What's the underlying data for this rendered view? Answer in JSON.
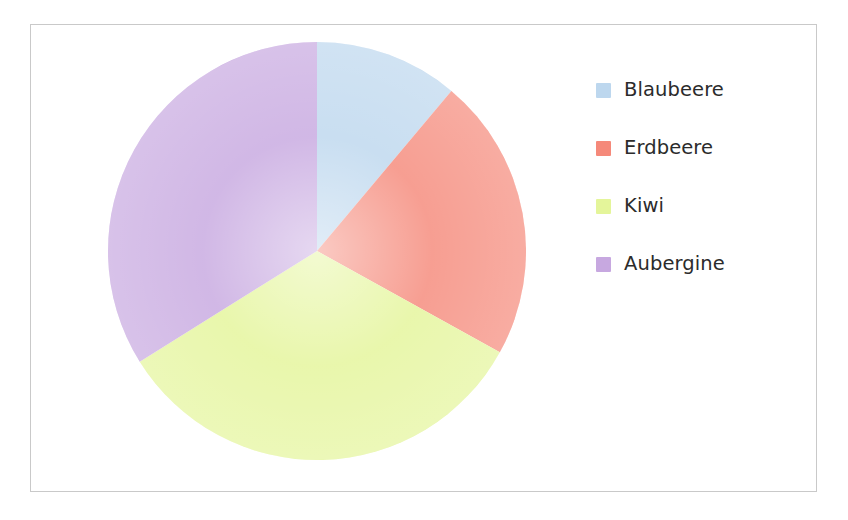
{
  "chart_data": {
    "type": "pie",
    "title": "",
    "subtitle": "",
    "xlabel": "",
    "ylabel": "",
    "grid": false,
    "legend_position": "right",
    "start_angle_deg": 0,
    "direction": "clockwise",
    "categories": [
      "Blaubeere",
      "Erdbeere",
      "Kiwi",
      "Aubergine"
    ],
    "values": [
      11,
      22,
      33,
      34
    ],
    "percentages": [
      "11%",
      "22%",
      "33%",
      "34%"
    ],
    "slice_angles_deg": [
      40,
      79,
      119,
      122
    ],
    "colors": [
      "#bdd7ee",
      "#f5897a",
      "#e4f59a",
      "#c7a8e0"
    ],
    "slices": [
      {
        "label": "Blaubeere",
        "value": 11,
        "percent": "11%",
        "color": "#bdd7ee",
        "start_deg": 0,
        "end_deg": 40
      },
      {
        "label": "Erdbeere",
        "value": 22,
        "percent": "22%",
        "color": "#f5897a",
        "start_deg": 40,
        "end_deg": 119
      },
      {
        "label": "Kiwi",
        "value": 33,
        "percent": "33%",
        "color": "#e4f59a",
        "start_deg": 119,
        "end_deg": 238
      },
      {
        "label": "Aubergine",
        "value": 34,
        "percent": "34%",
        "color": "#c7a8e0",
        "start_deg": 238,
        "end_deg": 360
      }
    ]
  },
  "legend": {
    "items": [
      {
        "label": "Blaubeere",
        "color": "#bdd7ee"
      },
      {
        "label": "Erdbeere",
        "color": "#f5897a"
      },
      {
        "label": "Kiwi",
        "color": "#e4f59a"
      },
      {
        "label": "Aubergine",
        "color": "#c7a8e0"
      }
    ]
  },
  "frame": {
    "border_color": "#c9c9c9",
    "background_color": "#ffffff"
  }
}
